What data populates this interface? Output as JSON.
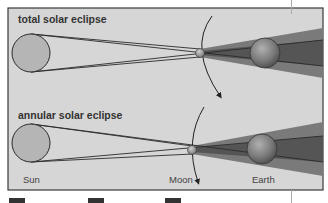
{
  "diagram": {
    "panels": [
      {
        "title": "total solar eclipse"
      },
      {
        "title": "annular solar eclipse"
      }
    ],
    "labels": {
      "sun": "Sun",
      "moon": "Moon",
      "earth": "Earth"
    },
    "colors": {
      "background": "#d4d4d4",
      "frame": "#3a3a3a",
      "sun": "#b8b8b8",
      "cone_dark": "#5a5a5a",
      "cone_mid": "#7a7a7a",
      "earth": "#8a8a8a"
    },
    "icons": [
      "orbit-arrow-icon"
    ]
  }
}
